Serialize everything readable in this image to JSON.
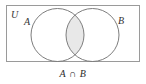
{
  "figure": {
    "title_caption": "A ∩ B",
    "universe_label": "U",
    "set_a_label": "A",
    "set_b_label": "B",
    "shaded_region": "intersection",
    "colors": {
      "background": "#ffffff",
      "stroke": "#7d7d7d",
      "rect_stroke": "#9a9a9a",
      "shade_fill": "#e8e8e8",
      "text": "#333333",
      "caption_text": "#2b2b2b"
    },
    "geometry": {
      "rect": {
        "x": 6,
        "y": 5,
        "width": 134,
        "height": 57
      },
      "circle_a": {
        "cx": 57.5,
        "cy": 35,
        "r": 26.5
      },
      "circle_b": {
        "cx": 92.5,
        "cy": 35,
        "r": 26.5
      }
    }
  }
}
